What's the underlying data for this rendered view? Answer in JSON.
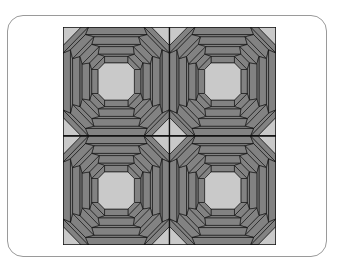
{
  "figure": {
    "rows": 2,
    "cols": 2,
    "blocks": [
      {
        "row": 0,
        "col": 0
      },
      {
        "row": 0,
        "col": 1
      },
      {
        "row": 1,
        "col": 0
      },
      {
        "row": 1,
        "col": 1
      }
    ],
    "colors": {
      "light": "#c9c9c9",
      "dark": "#828282",
      "outline": "#111111",
      "card_border": "#9a9a9a"
    }
  }
}
